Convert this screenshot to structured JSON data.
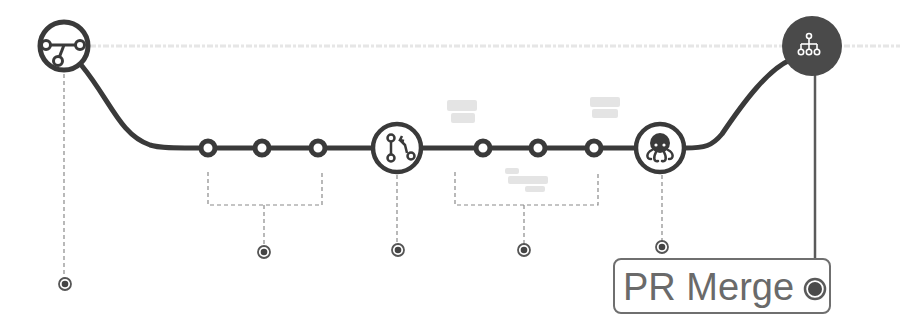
{
  "diagram": {
    "colors": {
      "track": "#3a3a3a",
      "node_fill": "#ffffff",
      "dark_node": "#4a4a4a",
      "dotted": "#8a8a8a",
      "label_border": "#6f6f6f",
      "label_text": "#6a6a6a",
      "faint_text": "#e2e2e2"
    },
    "nodes": [
      {
        "id": "branch",
        "icon": "git-branch-icon",
        "x": 64,
        "y": 46,
        "r": 26,
        "style": "outline"
      },
      {
        "id": "commit-1",
        "icon": "commit-dot",
        "x": 208,
        "y": 148,
        "r": 8,
        "style": "dot"
      },
      {
        "id": "commit-2",
        "icon": "commit-dot",
        "x": 262,
        "y": 148,
        "r": 8,
        "style": "dot"
      },
      {
        "id": "commit-3",
        "icon": "commit-dot",
        "x": 318,
        "y": 148,
        "r": 8,
        "style": "dot"
      },
      {
        "id": "pull-request",
        "icon": "git-pull-request-icon",
        "x": 397,
        "y": 148,
        "r": 25,
        "style": "outline"
      },
      {
        "id": "commit-4",
        "icon": "commit-dot",
        "x": 483,
        "y": 148,
        "r": 8,
        "style": "dot"
      },
      {
        "id": "commit-5",
        "icon": "commit-dot",
        "x": 538,
        "y": 148,
        "r": 8,
        "style": "dot"
      },
      {
        "id": "commit-6",
        "icon": "commit-dot",
        "x": 594,
        "y": 148,
        "r": 8,
        "style": "dot"
      },
      {
        "id": "github",
        "icon": "octopus-icon",
        "x": 660,
        "y": 148,
        "r": 25,
        "style": "outline"
      },
      {
        "id": "merge",
        "icon": "hierarchy-icon",
        "x": 812,
        "y": 46,
        "r": 30,
        "style": "filled"
      }
    ],
    "markers": [
      {
        "id": "marker-branch",
        "x": 65,
        "y": 284
      },
      {
        "id": "marker-commits-a",
        "x": 264,
        "y": 252
      },
      {
        "id": "marker-pull-request",
        "x": 398,
        "y": 250
      },
      {
        "id": "marker-commits-b",
        "x": 524,
        "y": 250
      },
      {
        "id": "marker-github",
        "x": 662,
        "y": 247
      }
    ],
    "label": {
      "text": "PR Merge",
      "marker": "filled-circle"
    }
  }
}
